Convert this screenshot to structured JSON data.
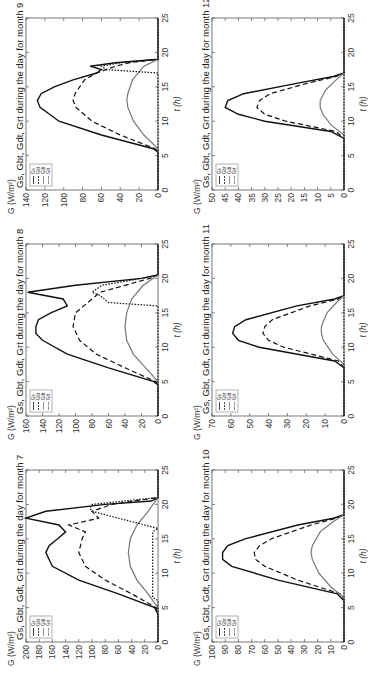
{
  "page": {
    "orientation": "rotated 90° counter-clockwise"
  },
  "style": {
    "Gs": {
      "color": "#111111",
      "dash": ""
    },
    "Gbt": {
      "color": "#111111",
      "dash": "5,3"
    },
    "Gdt": {
      "color": "#777777",
      "dash": ""
    },
    "Grt": {
      "color": "#111111",
      "dash": "1.5,1.5"
    }
  },
  "chart_data": [
    {
      "type": "line",
      "title": "Gs, Gbt, Gdt, Grt during the day for month 7",
      "xlabel": "t (h)",
      "ylabel": "G (W/m²)",
      "xlim": [
        0,
        25
      ],
      "ylim": [
        0,
        200
      ],
      "xticks": [
        0,
        5,
        10,
        15,
        20,
        25
      ],
      "yticks": [
        0,
        20,
        40,
        60,
        80,
        100,
        120,
        140,
        160,
        180,
        200
      ],
      "legend": [
        "Gs",
        "Gbt",
        "Gdt",
        "Grt"
      ],
      "legend_position": "upper left",
      "grid": false,
      "series": [
        {
          "name": "Gs",
          "x": [
            0,
            4,
            5,
            7,
            9,
            11,
            13,
            14,
            15,
            16,
            17,
            18,
            19,
            20,
            20.5,
            21,
            25
          ],
          "y": [
            0,
            0,
            5,
            60,
            120,
            160,
            170,
            165,
            152,
            140,
            150,
            200,
            170,
            80,
            10,
            0,
            0
          ]
        },
        {
          "name": "Gbt",
          "x": [
            0,
            4,
            5,
            7,
            9,
            11,
            13,
            15,
            16,
            17,
            18,
            19,
            20,
            21,
            25
          ],
          "y": [
            0,
            0,
            3,
            40,
            80,
            110,
            120,
            115,
            110,
            135,
            90,
            100,
            70,
            0,
            0
          ]
        },
        {
          "name": "Gdt",
          "x": [
            0,
            5,
            7,
            9,
            11,
            13,
            15,
            17,
            19,
            21,
            25
          ],
          "y": [
            0,
            0,
            15,
            32,
            42,
            45,
            42,
            32,
            15,
            0,
            0
          ]
        },
        {
          "name": "Grt",
          "x": [
            0,
            6,
            6.5,
            16,
            16.5,
            19,
            19.5,
            20,
            21,
            25
          ],
          "y": [
            0,
            0,
            8,
            8,
            0,
            100,
            103,
            100,
            0,
            0
          ]
        }
      ]
    },
    {
      "type": "line",
      "title": "Gs, Gbt, Gdt, Grt during the day for month 8",
      "xlabel": "t (h)",
      "ylabel": "G (W/m²)",
      "xlim": [
        0,
        25
      ],
      "ylim": [
        0,
        160
      ],
      "xticks": [
        0,
        5,
        10,
        15,
        20,
        25
      ],
      "yticks": [
        0,
        20,
        40,
        60,
        80,
        100,
        120,
        140,
        160
      ],
      "legend": [
        "Gs",
        "Gbt",
        "Gdt",
        "Grt"
      ],
      "legend_position": "upper left",
      "grid": false,
      "series": [
        {
          "name": "Gs",
          "x": [
            0,
            4.5,
            5,
            7,
            9,
            11,
            12,
            13,
            14,
            15,
            16,
            17,
            18,
            19,
            20,
            20.5,
            25
          ],
          "y": [
            0,
            0,
            5,
            60,
            110,
            140,
            148,
            148,
            145,
            130,
            110,
            115,
            158,
            100,
            20,
            0,
            0
          ]
        },
        {
          "name": "Gbt",
          "x": [
            0,
            4.5,
            5,
            7,
            9,
            11,
            13,
            15,
            16,
            17,
            18,
            19,
            20,
            20.5,
            25
          ],
          "y": [
            0,
            0,
            3,
            40,
            75,
            95,
            103,
            100,
            90,
            80,
            70,
            40,
            10,
            0,
            0
          ]
        },
        {
          "name": "Gdt",
          "x": [
            0,
            5,
            7,
            9,
            11,
            13,
            15,
            17,
            19,
            20.5,
            25
          ],
          "y": [
            0,
            0,
            15,
            30,
            38,
            40,
            38,
            32,
            18,
            0,
            0
          ]
        },
        {
          "name": "Grt",
          "x": [
            0,
            5,
            16,
            16.5,
            17.5,
            18,
            19,
            20,
            20.5,
            25
          ],
          "y": [
            0,
            0,
            0,
            60,
            70,
            80,
            68,
            20,
            0,
            0
          ]
        }
      ]
    },
    {
      "type": "line",
      "title": "Gs, Gbt, Gdt, Grt during the day for month 9",
      "xlabel": "t (h)",
      "ylabel": "G (W/m²)",
      "xlim": [
        0,
        25
      ],
      "ylim": [
        0,
        140
      ],
      "xticks": [
        0,
        5,
        10,
        15,
        20,
        25
      ],
      "yticks": [
        0,
        20,
        40,
        60,
        80,
        100,
        120,
        140
      ],
      "legend": [
        "Gs",
        "Gbt",
        "Gdt",
        "Grt"
      ],
      "legend_position": "upper left",
      "grid": false,
      "series": [
        {
          "name": "Gs",
          "x": [
            0,
            5.5,
            6,
            8,
            10,
            12,
            13,
            14,
            15,
            16,
            17,
            17.5,
            18,
            18.5,
            19,
            25
          ],
          "y": [
            0,
            0,
            5,
            60,
            105,
            125,
            128,
            124,
            110,
            90,
            65,
            60,
            72,
            45,
            0,
            0
          ]
        },
        {
          "name": "Gbt",
          "x": [
            0,
            5.5,
            6,
            8,
            10,
            12,
            13,
            14,
            16,
            17,
            18,
            18.5,
            19,
            25
          ],
          "y": [
            0,
            0,
            3,
            40,
            70,
            87,
            90,
            88,
            78,
            65,
            45,
            30,
            0,
            0
          ]
        },
        {
          "name": "Gdt",
          "x": [
            0,
            6,
            8,
            10,
            12,
            13,
            14,
            16,
            18,
            19,
            25
          ],
          "y": [
            0,
            0,
            15,
            26,
            32,
            33,
            32,
            27,
            15,
            0,
            0
          ]
        },
        {
          "name": "Grt",
          "x": [
            0,
            6,
            17,
            17.5,
            18,
            18.5,
            19,
            25
          ],
          "y": [
            0,
            0,
            0,
            55,
            60,
            40,
            0,
            0
          ]
        }
      ]
    },
    {
      "type": "line",
      "title": "Gs, Gbt, Gdt, Grt during the day for month 10",
      "xlabel": "t (h)",
      "ylabel": "G (W/m²)",
      "xlim": [
        0,
        25
      ],
      "ylim": [
        0,
        100
      ],
      "xticks": [
        0,
        5,
        10,
        15,
        20,
        25
      ],
      "yticks": [
        0,
        10,
        20,
        30,
        40,
        50,
        60,
        70,
        80,
        90,
        100
      ],
      "legend": [
        "Gs",
        "Gbt",
        "Gdt",
        "Grt"
      ],
      "legend_position": "upper left",
      "grid": false,
      "series": [
        {
          "name": "Gs",
          "x": [
            0,
            6,
            7,
            9,
            11,
            12,
            13,
            14,
            15,
            17,
            18,
            18.5,
            25
          ],
          "y": [
            0,
            0,
            5,
            50,
            85,
            92,
            92,
            88,
            75,
            35,
            8,
            0,
            0
          ]
        },
        {
          "name": "Gbt",
          "x": [
            0,
            6,
            7,
            9,
            11,
            12,
            13,
            14,
            15,
            17,
            18,
            18.5,
            25
          ],
          "y": [
            0,
            0,
            3,
            35,
            60,
            67,
            68,
            64,
            55,
            25,
            6,
            0,
            0
          ]
        },
        {
          "name": "Gdt",
          "x": [
            0,
            6.5,
            8,
            10,
            12,
            13,
            14,
            16,
            17.5,
            18.5,
            25
          ],
          "y": [
            0,
            0,
            10,
            19,
            24,
            25,
            24,
            18,
            8,
            0,
            0
          ]
        },
        {
          "name": "Grt",
          "x": [
            0,
            25
          ],
          "y": [
            0,
            0
          ]
        }
      ]
    },
    {
      "type": "line",
      "title": "Gs, Gbt, Gdt, Grt during the day for month 11",
      "xlabel": "t (h)",
      "ylabel": "G (W/m²)",
      "xlim": [
        0,
        25
      ],
      "ylim": [
        0,
        70
      ],
      "xticks": [
        0,
        5,
        10,
        15,
        20,
        25
      ],
      "yticks": [
        0,
        10,
        20,
        30,
        40,
        50,
        60,
        70
      ],
      "legend": [
        "Gs",
        "Gbt",
        "Gdt",
        "Grt"
      ],
      "legend_position": "upper left",
      "grid": false,
      "series": [
        {
          "name": "Gs",
          "x": [
            0,
            7,
            8,
            10,
            11,
            12,
            13,
            14,
            16,
            17,
            17.5,
            25
          ],
          "y": [
            0,
            0,
            5,
            45,
            56,
            59,
            58,
            52,
            25,
            5,
            0,
            0
          ]
        },
        {
          "name": "Gbt",
          "x": [
            0,
            7,
            8,
            10,
            11,
            12,
            13,
            14,
            16,
            17,
            17.5,
            25
          ],
          "y": [
            0,
            0,
            3,
            32,
            40,
            43,
            42,
            38,
            18,
            3,
            0,
            0
          ]
        },
        {
          "name": "Gdt",
          "x": [
            0,
            7.5,
            9,
            11,
            12,
            13,
            15,
            16.5,
            17.5,
            25
          ],
          "y": [
            0,
            0,
            6,
            11,
            12,
            12,
            9,
            4,
            0,
            0
          ]
        },
        {
          "name": "Grt",
          "x": [
            0,
            25
          ],
          "y": [
            0,
            0
          ]
        }
      ]
    },
    {
      "type": "line",
      "title": "Gs, Gbt, Gdt, Grt during the day for month 12",
      "xlabel": "t (h)",
      "ylabel": "G (W/m²)",
      "xlim": [
        0,
        25
      ],
      "ylim": [
        0,
        50
      ],
      "xticks": [
        0,
        5,
        10,
        15,
        20,
        25
      ],
      "yticks": [
        0,
        5,
        10,
        15,
        20,
        25,
        30,
        35,
        40,
        45,
        50
      ],
      "legend": [
        "Gs",
        "Gbt",
        "Gdt",
        "Grt"
      ],
      "legend_position": "upper left",
      "grid": false,
      "series": [
        {
          "name": "Gs",
          "x": [
            0,
            7.5,
            8.5,
            10,
            11,
            12,
            13,
            14,
            15.5,
            16.5,
            17,
            25
          ],
          "y": [
            0,
            0,
            5,
            30,
            40,
            45,
            44,
            38,
            18,
            4,
            0,
            0
          ]
        },
        {
          "name": "Gbt",
          "x": [
            0,
            7.5,
            8.5,
            10,
            11,
            12,
            13,
            14,
            15.5,
            16.5,
            17,
            25
          ],
          "y": [
            0,
            0,
            3,
            22,
            30,
            33,
            32,
            28,
            14,
            3,
            0,
            0
          ]
        },
        {
          "name": "Gdt",
          "x": [
            0,
            8,
            9.5,
            11,
            12,
            13,
            14.5,
            16,
            17,
            25
          ],
          "y": [
            0,
            0,
            5,
            8,
            9,
            9,
            7,
            3,
            0,
            0
          ]
        },
        {
          "name": "Grt",
          "x": [
            0,
            25
          ],
          "y": [
            0,
            0
          ]
        }
      ]
    }
  ]
}
